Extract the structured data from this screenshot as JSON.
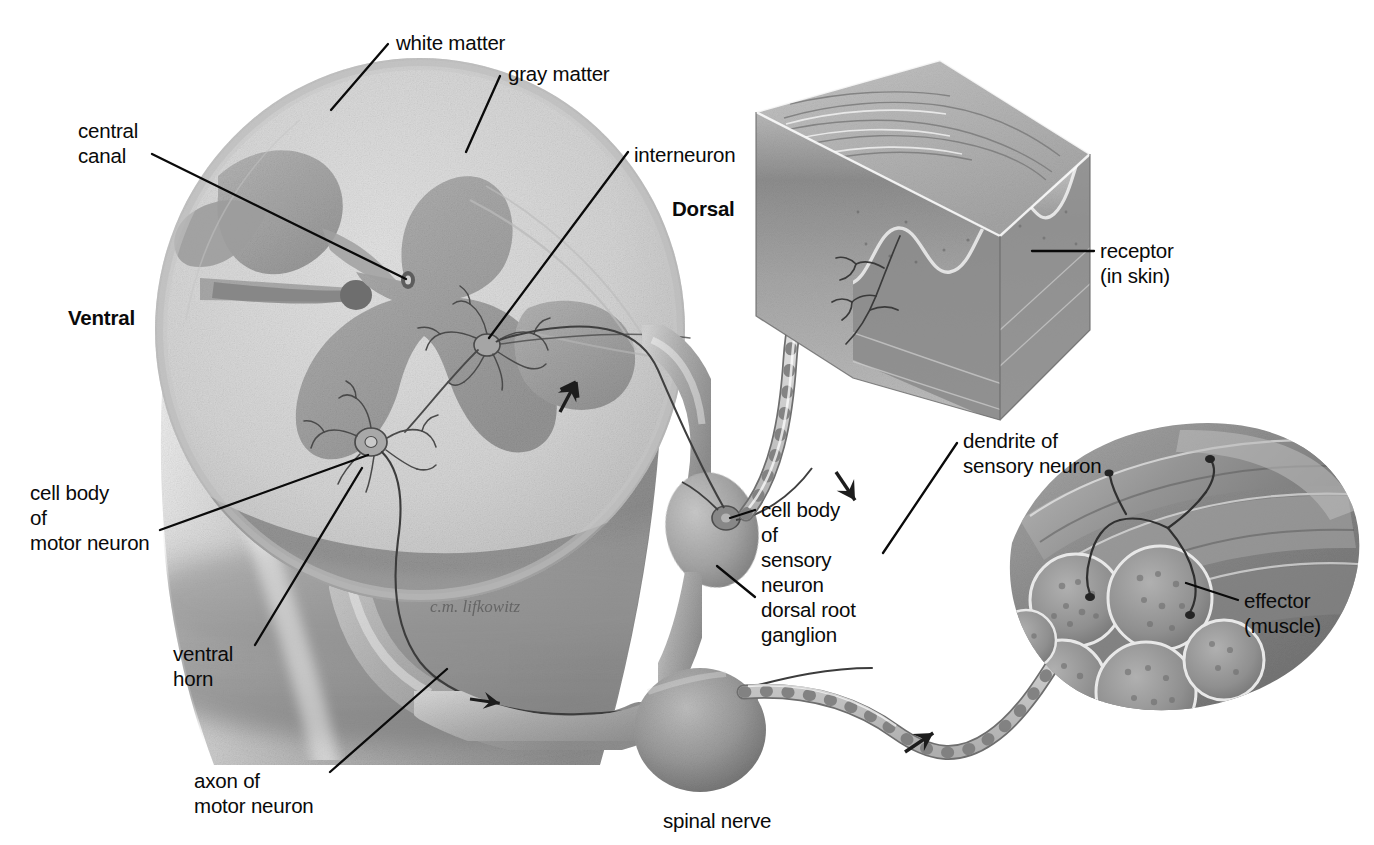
{
  "figure": {
    "background_color": "#ffffff",
    "ink_color": "#0a0a0a"
  },
  "orientation_labels": [
    {
      "name": "ventral",
      "text": "Ventral",
      "bold": true,
      "x": 68,
      "y": 305
    },
    {
      "name": "dorsal",
      "text": "Dorsal",
      "bold": true,
      "x": 672,
      "y": 196
    }
  ],
  "labels": [
    {
      "name": "white-matter",
      "lines": [
        "white matter"
      ],
      "x": 396,
      "y": 30,
      "align": "left"
    },
    {
      "name": "gray-matter",
      "lines": [
        "gray matter"
      ],
      "x": 508,
      "y": 61,
      "align": "left"
    },
    {
      "name": "central-canal",
      "lines": [
        "central",
        "canal"
      ],
      "x": 78,
      "y": 118,
      "align": "left"
    },
    {
      "name": "interneuron",
      "lines": [
        "interneuron"
      ],
      "x": 634,
      "y": 142,
      "align": "left"
    },
    {
      "name": "receptor-in-skin",
      "lines": [
        "receptor",
        "(in skin)"
      ],
      "x": 1100,
      "y": 238,
      "align": "left"
    },
    {
      "name": "cell-body-motor-neuron",
      "lines": [
        "cell body",
        "of",
        "motor neuron"
      ],
      "x": 30,
      "y": 480,
      "align": "left"
    },
    {
      "name": "cell-body-sensory-neuron",
      "lines": [
        "cell body",
        "of",
        "sensory",
        "neuron"
      ],
      "x": 761,
      "y": 497,
      "align": "left"
    },
    {
      "name": "dorsal-root-ganglion",
      "lines": [
        "dorsal root",
        "ganglion"
      ],
      "x": 761,
      "y": 597,
      "align": "left"
    },
    {
      "name": "dendrite-sensory-neuron",
      "lines": [
        "dendrite of",
        "sensory neuron"
      ],
      "x": 963,
      "y": 428,
      "align": "left"
    },
    {
      "name": "effector-muscle",
      "lines": [
        "effector",
        "(muscle)"
      ],
      "x": 1244,
      "y": 588,
      "align": "left"
    },
    {
      "name": "ventral-horn",
      "lines": [
        "ventral",
        "horn"
      ],
      "x": 173,
      "y": 641,
      "align": "left"
    },
    {
      "name": "axon-of-motor-neuron",
      "lines": [
        "axon of",
        "motor neuron"
      ],
      "x": 194,
      "y": 768,
      "align": "left"
    },
    {
      "name": "spinal-nerve",
      "lines": [
        "spinal nerve"
      ],
      "x": 663,
      "y": 808,
      "align": "left"
    }
  ],
  "leader_lines": [
    {
      "name": "leader-white-matter",
      "points": "388,44 331,110"
    },
    {
      "name": "leader-gray-matter",
      "points": "500,76 466,152"
    },
    {
      "name": "leader-central-canal",
      "points": "152,154 406,279"
    },
    {
      "name": "leader-interneuron",
      "points": "628,152 489,338"
    },
    {
      "name": "leader-receptor",
      "points": "1094,251 1032,251"
    },
    {
      "name": "leader-cell-body-motor",
      "points": "160,530 368,455"
    },
    {
      "name": "leader-cell-body-sensory",
      "points": "755,510 730,518"
    },
    {
      "name": "leader-dorsal-root-ganglion",
      "points": "755,597 717,566"
    },
    {
      "name": "leader-dendrite-sensory",
      "points": "957,443 883,553"
    },
    {
      "name": "leader-effector",
      "points": "1238,600 1186,583"
    },
    {
      "name": "leader-ventral-horn",
      "points": "255,645 362,468"
    },
    {
      "name": "leader-axon-motor",
      "points": "330,772 447,669"
    }
  ],
  "anatomy": {
    "spinal_cord": {
      "name": "spinal-cord-cross-section",
      "white_matter_color": "#d6d6d6",
      "gray_matter_color": "#a9a9a9",
      "body_shadow_color": "#9a9a9a"
    },
    "skin_block": {
      "name": "skin-block",
      "epidermis_color": "#b6b6b6",
      "dermis_color": "#8f8f8f",
      "side_color": "#a0a0a0"
    },
    "muscle": {
      "name": "muscle-effector",
      "surface_color": "#8b8b8b",
      "fascicle_color": "#9c9c9c"
    },
    "nerve_fiber_color": "#d8d8d8",
    "nerve_outline_color": "#707070"
  },
  "flow_arrows": [
    {
      "name": "arrow-sensory-inbound",
      "x": 560,
      "y": 412,
      "rotation": -62
    },
    {
      "name": "arrow-sensory-descend",
      "x": 836,
      "y": 472,
      "rotation": 56
    },
    {
      "name": "arrow-motor-outbound",
      "x": 470,
      "y": 699,
      "rotation": 8
    },
    {
      "name": "arrow-motor-to-muscle",
      "x": 905,
      "y": 752,
      "rotation": -34
    }
  ],
  "signature": {
    "name": "artist-signature",
    "text": "c.m. lifkowitz",
    "x": 430,
    "y": 612
  }
}
